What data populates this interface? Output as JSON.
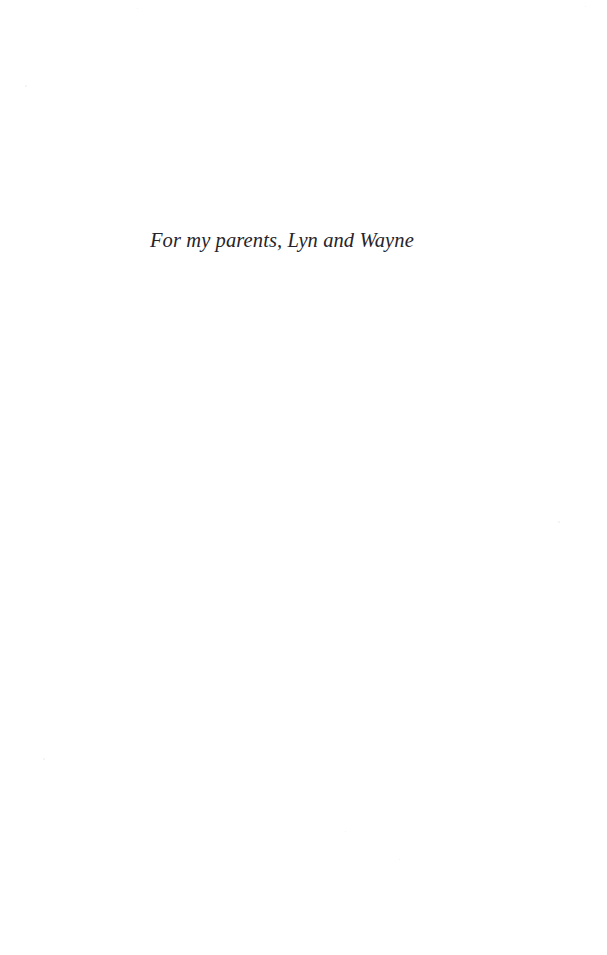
{
  "page": {
    "kind": "book-dedication-page",
    "width": 607,
    "height": 955,
    "background_color": "#ffffff",
    "ink_color": "#26242a"
  },
  "dedication": {
    "text": "For my parents, Lyn and Wayne"
  }
}
